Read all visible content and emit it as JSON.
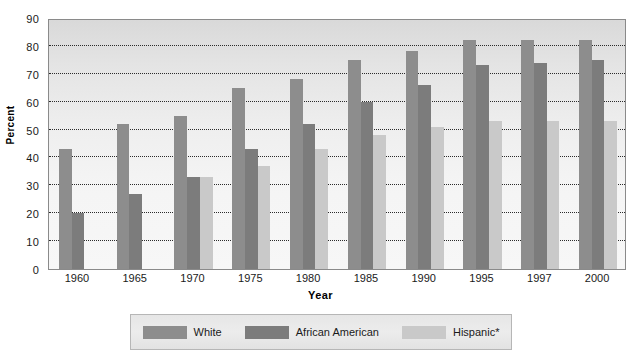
{
  "chart_data": {
    "type": "bar",
    "title": "",
    "xlabel": "Year",
    "ylabel": "Percent",
    "categories": [
      "1960",
      "1965",
      "1970",
      "1975",
      "1980",
      "1985",
      "1990",
      "1995",
      "1997",
      "2000"
    ],
    "series": [
      {
        "name": "White",
        "color": "#8d8d8d",
        "values": [
          43,
          52,
          55,
          65,
          68,
          75,
          78,
          82,
          82,
          82
        ]
      },
      {
        "name": "African American",
        "color": "#7c7c7c",
        "values": [
          20,
          27,
          33,
          43,
          52,
          60,
          66,
          73,
          74,
          75
        ]
      },
      {
        "name": "Hispanic*",
        "color": "#c9c9c9",
        "values": [
          null,
          null,
          33,
          37,
          43,
          48,
          51,
          53,
          53,
          53
        ]
      }
    ],
    "ylim": [
      0,
      90
    ],
    "yticks": [
      0,
      10,
      20,
      30,
      40,
      50,
      60,
      70,
      80,
      90
    ],
    "ytick_labels": [
      "0",
      "10",
      "20",
      "30",
      "40",
      "50",
      "60",
      "70",
      "80",
      "90"
    ],
    "grid": true,
    "grid_style": "dotted-horizontal",
    "legend_position": "bottom"
  },
  "legend": {
    "items": [
      {
        "label": "White"
      },
      {
        "label": "African American"
      },
      {
        "label": "Hispanic*"
      }
    ]
  }
}
